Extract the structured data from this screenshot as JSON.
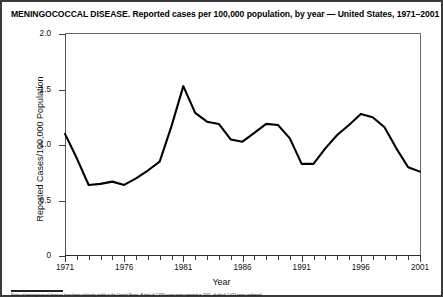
{
  "figure": {
    "title": "MENINGOCOCCAL DISEASE. Reported cases per 100,000 population, by year — United States, 1971–2001",
    "footnote": "Rates of meningococcal disease have been relatively stable in the United States. A total of 2,333 cases were reported in 2001, of which 1,024 were confirmed."
  },
  "chart_data": {
    "type": "line",
    "title": "MENINGOCOCCAL DISEASE. Reported cases per 100,000 population, by year — United States, 1971–2001",
    "xlabel": "Year",
    "ylabel": "Reported Cases/100,000 Population",
    "xlim": [
      1971,
      2001
    ],
    "ylim": [
      0,
      2.0
    ],
    "yticks": [
      0,
      0.5,
      1.0,
      1.5,
      2.0
    ],
    "ytick_labels": [
      "0",
      "0.5",
      "1.0",
      "1.5",
      "2.0"
    ],
    "xticks": [
      1971,
      1976,
      1981,
      1986,
      1991,
      1996,
      2001
    ],
    "xtick_labels": [
      "1971",
      "1976",
      "1981",
      "1986",
      "1991",
      "1996",
      "2001"
    ],
    "minor_xtick_interval": 1,
    "grid": false,
    "legend": null,
    "line_color": "#000000",
    "line_width": 2.1,
    "x": [
      1971,
      1972,
      1973,
      1974,
      1975,
      1976,
      1977,
      1978,
      1979,
      1980,
      1981,
      1982,
      1983,
      1984,
      1985,
      1986,
      1987,
      1988,
      1989,
      1990,
      1991,
      1992,
      1993,
      1994,
      1995,
      1996,
      1997,
      1998,
      1999,
      2000,
      2001
    ],
    "values": [
      1.1,
      0.88,
      0.64,
      0.65,
      0.67,
      0.64,
      0.7,
      0.77,
      0.85,
      1.17,
      1.53,
      1.29,
      1.21,
      1.19,
      1.05,
      1.03,
      1.11,
      1.19,
      1.18,
      1.06,
      0.83,
      0.83,
      0.97,
      1.09,
      1.18,
      1.28,
      1.25,
      1.16,
      0.97,
      0.8,
      0.76
    ]
  },
  "axes": {
    "y_title": "Reported Cases/100,000 Population",
    "x_title": "Year"
  }
}
